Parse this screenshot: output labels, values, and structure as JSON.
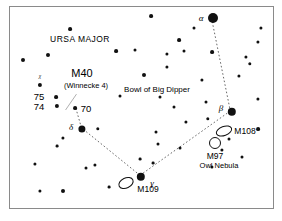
{
  "chart_data": {
    "type": "scatter",
    "title": "URSA MAJOR",
    "subtitle": "Bowl of Big Dipper",
    "xlabel": "",
    "ylabel": "",
    "grid": false,
    "legend": "none",
    "xlim": [
      0,
      265
    ],
    "ylim": [
      0,
      203
    ],
    "labels": {
      "constellation": "URSA MAJOR",
      "region": "Bowl of Big Dipper",
      "m40": "M40",
      "m40_alt": "(Winnecke 4)",
      "m108": "M108",
      "m109": "M109",
      "m97": "M97",
      "m97_alt": "Owl Nebula",
      "star_70": "70",
      "star_75": "75",
      "star_74": "74",
      "greek_alpha": "α",
      "greek_beta": "β",
      "greek_gamma": "γ",
      "greek_delta": "δ",
      "greek_chi": "χ"
    },
    "colors": {
      "star": "#111111",
      "background": "#ffffff",
      "border": "#8a8a8a",
      "line": "#555555"
    },
    "named_stars": [
      {
        "name": "alpha-dubhe",
        "label": "α",
        "x": 203,
        "y": 11,
        "r": 5.0
      },
      {
        "name": "beta-merak",
        "label": "β",
        "x": 222,
        "y": 105,
        "r": 4.2
      },
      {
        "name": "gamma-phecda",
        "label": "γ",
        "x": 131,
        "y": 170,
        "r": 4.2
      },
      {
        "name": "delta-megrez",
        "label": "δ",
        "x": 72,
        "y": 122,
        "r": 3.6
      }
    ],
    "labeled_stars": [
      {
        "name": "star-70",
        "label": "70",
        "x": 65,
        "y": 101,
        "r": 1.9
      },
      {
        "name": "star-75",
        "label": "75",
        "x": 46,
        "y": 90,
        "r": 1.9
      },
      {
        "name": "star-74",
        "label": "74",
        "x": 47,
        "y": 99,
        "r": 2.1
      },
      {
        "name": "star-chi",
        "label": "χ",
        "x": 30,
        "y": 78,
        "r": 2.1
      }
    ],
    "deep_sky_objects": [
      {
        "name": "m40",
        "label": "M40",
        "type": "double-star",
        "x": 72,
        "y": 96
      },
      {
        "name": "m108",
        "label": "M108",
        "type": "galaxy",
        "x": 214,
        "y": 124,
        "rx": 7.5,
        "ry": 4.0,
        "rot": -20
      },
      {
        "name": "m109",
        "label": "M109",
        "type": "galaxy",
        "x": 116,
        "y": 176,
        "rx": 7.0,
        "ry": 4.5,
        "rot": -25
      },
      {
        "name": "m97",
        "label": "M97",
        "type": "planetary-nebula",
        "x": 205,
        "y": 136,
        "rx": 5.0,
        "ry": 5.0,
        "rot": 0
      }
    ],
    "field_stars": [
      {
        "x": 141,
        "y": 9,
        "r": 1.9
      },
      {
        "x": 184,
        "y": 21,
        "r": 1.5
      },
      {
        "x": 60,
        "y": 22,
        "r": 1.9
      },
      {
        "x": 251,
        "y": 21,
        "r": 1.6
      },
      {
        "x": 248,
        "y": 35,
        "r": 1.6
      },
      {
        "x": 157,
        "y": 47,
        "r": 1.6
      },
      {
        "x": 38,
        "y": 48,
        "r": 2.0
      },
      {
        "x": 106,
        "y": 44,
        "r": 1.9
      },
      {
        "x": 202,
        "y": 45,
        "r": 1.9
      },
      {
        "x": 13,
        "y": 53,
        "r": 2.0
      },
      {
        "x": 169,
        "y": 33,
        "r": 1.9
      },
      {
        "x": 174,
        "y": 44,
        "r": 1.5
      },
      {
        "x": 157,
        "y": 60,
        "r": 1.6
      },
      {
        "x": 134,
        "y": 68,
        "r": 2.0
      },
      {
        "x": 236,
        "y": 50,
        "r": 1.6
      },
      {
        "x": 240,
        "y": 57,
        "r": 1.7
      },
      {
        "x": 229,
        "y": 69,
        "r": 1.6
      },
      {
        "x": 192,
        "y": 73,
        "r": 1.6
      },
      {
        "x": 110,
        "y": 89,
        "r": 1.5
      },
      {
        "x": 150,
        "y": 90,
        "r": 1.5
      },
      {
        "x": 248,
        "y": 92,
        "r": 1.6
      },
      {
        "x": 196,
        "y": 95,
        "r": 1.5
      },
      {
        "x": 164,
        "y": 100,
        "r": 1.5
      },
      {
        "x": 198,
        "y": 112,
        "r": 1.7
      },
      {
        "x": 176,
        "y": 115,
        "r": 1.6
      },
      {
        "x": 248,
        "y": 122,
        "r": 1.9
      },
      {
        "x": 219,
        "y": 132,
        "r": 1.5
      },
      {
        "x": 212,
        "y": 143,
        "r": 1.6
      },
      {
        "x": 170,
        "y": 141,
        "r": 1.5
      },
      {
        "x": 232,
        "y": 150,
        "r": 1.5
      },
      {
        "x": 202,
        "y": 160,
        "r": 1.6
      },
      {
        "x": 146,
        "y": 125,
        "r": 1.5
      },
      {
        "x": 148,
        "y": 137,
        "r": 1.5
      },
      {
        "x": 88,
        "y": 122,
        "r": 1.7
      },
      {
        "x": 53,
        "y": 131,
        "r": 1.6
      },
      {
        "x": 47,
        "y": 139,
        "r": 1.4
      },
      {
        "x": 25,
        "y": 157,
        "r": 1.6
      },
      {
        "x": 76,
        "y": 161,
        "r": 1.5
      },
      {
        "x": 85,
        "y": 158,
        "r": 1.6
      },
      {
        "x": 130,
        "y": 152,
        "r": 1.4
      },
      {
        "x": 143,
        "y": 156,
        "r": 1.4
      },
      {
        "x": 30,
        "y": 184,
        "r": 1.6
      },
      {
        "x": 53,
        "y": 184,
        "r": 2.0
      },
      {
        "x": 99,
        "y": 180,
        "r": 1.4
      },
      {
        "x": 125,
        "y": 43,
        "r": 1.5
      }
    ],
    "asterism_lines": [
      {
        "name": "alpha-beta",
        "from": [
          203,
          11
        ],
        "to": [
          222,
          105
        ]
      },
      {
        "name": "beta-gamma",
        "from": [
          222,
          105
        ],
        "to": [
          131,
          170
        ]
      },
      {
        "name": "gamma-delta",
        "from": [
          131,
          170
        ],
        "to": [
          72,
          122
        ]
      },
      {
        "name": "delta-m40",
        "from": [
          72,
          122
        ],
        "to": [
          66,
          101
        ]
      }
    ],
    "leader_lines": [
      {
        "name": "m40-leader",
        "from": [
          67,
          88
        ],
        "to": [
          56,
          104
        ]
      }
    ]
  }
}
